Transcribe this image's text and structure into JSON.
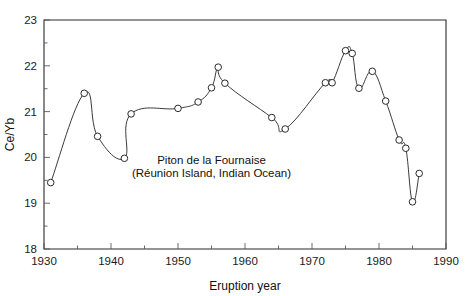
{
  "chart_data": {
    "type": "line",
    "title": "",
    "subtitle": "",
    "xlabel": "Eruption year",
    "ylabel": "Ce/Yb",
    "xlim": [
      1930,
      1990
    ],
    "ylim": [
      18,
      23
    ],
    "xticks": [
      1930,
      1940,
      1950,
      1960,
      1970,
      1980,
      1990
    ],
    "xtick_labels": [
      "1930",
      "1940",
      "1950",
      "1960",
      "1970",
      "1980",
      "1990"
    ],
    "xminor_ticks": [
      1935,
      1945,
      1955,
      1965,
      1975,
      1985
    ],
    "yticks": [
      18,
      19,
      20,
      21,
      22,
      23
    ],
    "ytick_labels": [
      "18",
      "19",
      "20",
      "21",
      "22",
      "23"
    ],
    "yminor_ticks": [
      18.5,
      19.5,
      20.5,
      21.5,
      22.5
    ],
    "grid": false,
    "legend": null,
    "marker": "open-circle",
    "line_color": "#3a3a3a",
    "marker_face_color": "#ffffff",
    "marker_edge_color": "#2b2b2b",
    "annotations": [
      {
        "name": "volcano-name",
        "text": "Piton de la Fournaise",
        "x": 1955.0,
        "y": 19.85
      },
      {
        "name": "volcano-location",
        "text": "(Réunion Island, Indian Ocean)",
        "x": 1955.0,
        "y": 19.57
      }
    ],
    "series": [
      {
        "name": "Ce/Yb ratio",
        "x": [
          1931.0,
          1936.0,
          1938.0,
          1942.0,
          1943.0,
          1950.0,
          1953.0,
          1955.0,
          1956.0,
          1957.0,
          1964.0,
          1966.0,
          1972.0,
          1973.0,
          1975.0,
          1976.0,
          1977.0,
          1979.0,
          1981.0,
          1983.0,
          1984.0,
          1985.0,
          1986.0
        ],
        "values": [
          19.45,
          21.4,
          20.46,
          19.98,
          20.95,
          21.07,
          21.21,
          21.52,
          21.97,
          21.62,
          20.87,
          20.62,
          21.63,
          21.63,
          22.33,
          22.27,
          21.51,
          21.88,
          21.23,
          20.38,
          20.2,
          19.03,
          19.65
        ]
      }
    ]
  },
  "plot_geometry": {
    "left": 44,
    "right": 446,
    "top": 20,
    "bottom": 249
  }
}
